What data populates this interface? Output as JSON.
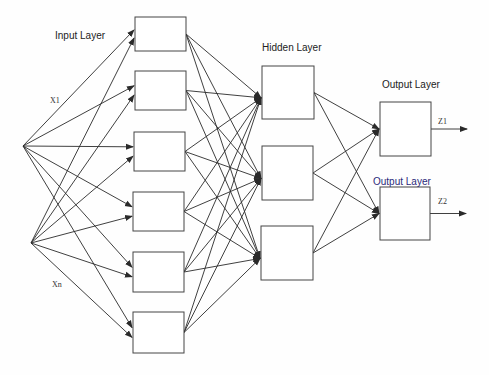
{
  "labels": {
    "input_layer": "Input Layer",
    "hidden_layer": "Hidden Layer",
    "output_layer_1": "Output Layer",
    "output_layer_2": "Output Layer",
    "x1": "X1",
    "xn": "Xn",
    "z1": "Z1",
    "z2": "Z2"
  },
  "colors": {
    "line": "#2a2a2a",
    "box_stroke": "#444444",
    "output_layer_2_text": "#2a2a7a"
  },
  "nodes": {
    "inputs": [
      {
        "id": "x1",
        "x": 23,
        "y": 146
      },
      {
        "id": "xn",
        "x": 31,
        "y": 243
      }
    ],
    "input_layer": [
      {
        "x": 135,
        "y": 17,
        "w": 51,
        "h": 34
      },
      {
        "x": 135,
        "y": 71,
        "w": 51,
        "h": 39
      },
      {
        "x": 134,
        "y": 132,
        "w": 51,
        "h": 39
      },
      {
        "x": 133,
        "y": 192,
        "w": 51,
        "h": 39
      },
      {
        "x": 133,
        "y": 252,
        "w": 51,
        "h": 40
      },
      {
        "x": 133,
        "y": 312,
        "w": 51,
        "h": 41
      }
    ],
    "hidden_layer": [
      {
        "x": 262,
        "y": 66,
        "w": 52,
        "h": 53
      },
      {
        "x": 262,
        "y": 146,
        "w": 51,
        "h": 54
      },
      {
        "x": 261,
        "y": 226,
        "w": 52,
        "h": 54
      }
    ],
    "output_layer": [
      {
        "x": 380,
        "y": 102,
        "w": 51,
        "h": 54
      },
      {
        "x": 380,
        "y": 187,
        "w": 50,
        "h": 53
      }
    ]
  }
}
